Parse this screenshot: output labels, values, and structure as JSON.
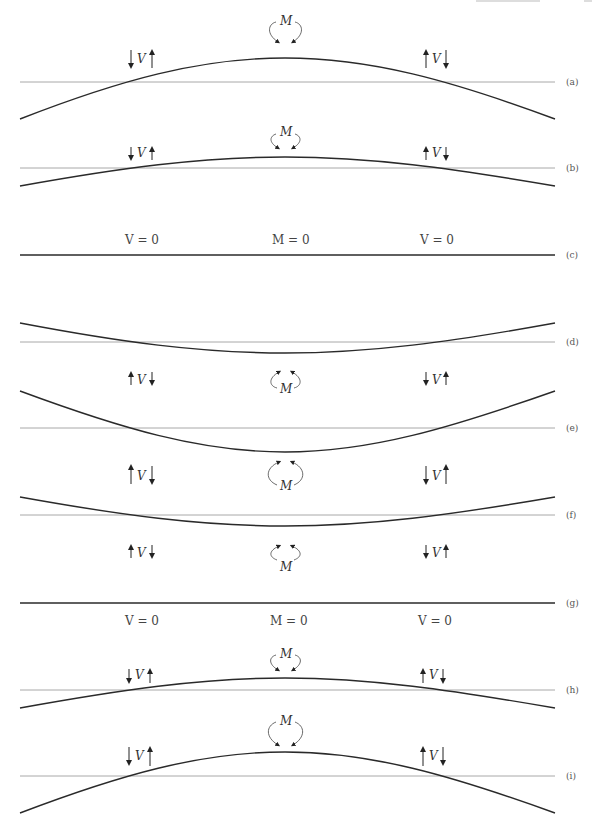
{
  "header": {
    "partial_text": "Section 3.5",
    "page_number": "1"
  },
  "symbols": {
    "shear": "V",
    "moment": "M"
  },
  "zero_labels": {
    "shear_zero": "V = 0",
    "moment_zero": "M = 0"
  },
  "colors": {
    "beam": "#2a2a2a",
    "baseline": "#a8a8a8",
    "text": "#333333"
  },
  "panels": [
    {
      "label": "(a)",
      "shape": "hogging",
      "amplitude": "large",
      "left_V": "down-up",
      "right_V": "up-down",
      "M_position": "above"
    },
    {
      "label": "(b)",
      "shape": "hogging",
      "amplitude": "small",
      "left_V": "down-up",
      "right_V": "up-down",
      "M_position": "above"
    },
    {
      "label": "(c)",
      "shape": "flat",
      "amplitude": "zero",
      "annotations": [
        "V = 0",
        "M = 0",
        "V = 0"
      ],
      "annotation_position": "above"
    },
    {
      "label": "(d)",
      "shape": "sagging",
      "amplitude": "small",
      "left_V": "up-down",
      "right_V": "down-up",
      "M_position": "below"
    },
    {
      "label": "(e)",
      "shape": "sagging",
      "amplitude": "large",
      "left_V": "up-down",
      "right_V": "down-up",
      "M_position": "below"
    },
    {
      "label": "(f)",
      "shape": "sagging",
      "amplitude": "small",
      "left_V": "up-down",
      "right_V": "down-up",
      "M_position": "below"
    },
    {
      "label": "(g)",
      "shape": "flat",
      "amplitude": "zero",
      "annotations": [
        "V = 0",
        "M = 0",
        "V = 0"
      ],
      "annotation_position": "below"
    },
    {
      "label": "(h)",
      "shape": "hogging",
      "amplitude": "small",
      "left_V": "down-up",
      "right_V": "up-down",
      "M_position": "above"
    },
    {
      "label": "(i)",
      "shape": "hogging",
      "amplitude": "large",
      "left_V": "down-up",
      "right_V": "up-down",
      "M_position": "above"
    }
  ]
}
